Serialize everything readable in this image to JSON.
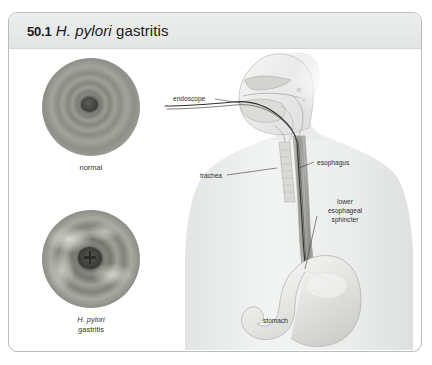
{
  "figure": {
    "number": "50.1",
    "title_italic": "H. pylori",
    "title_rest": "gastritis"
  },
  "photos": [
    {
      "name": "normal-endoscopy",
      "caption_line1": "normal",
      "caption_line2": ""
    },
    {
      "name": "h-pylori-gastritis-endoscopy",
      "caption_line1": "H. pylori",
      "caption_line2": "gastritis"
    }
  ],
  "anatomy": {
    "labels": {
      "endoscope": "endoscope",
      "trachea": "trachea",
      "esophagus": "esophagus",
      "les_line1": "lower",
      "les_line2": "esophageal",
      "les_line3": "sphincter",
      "stomach": "stomach"
    }
  },
  "colors": {
    "header_bg": "#e8e9e9",
    "border": "#b9bdc0",
    "body_silhouette": "#ececec",
    "label_text": "#2f302c",
    "title_text": "#1b1b1b"
  }
}
